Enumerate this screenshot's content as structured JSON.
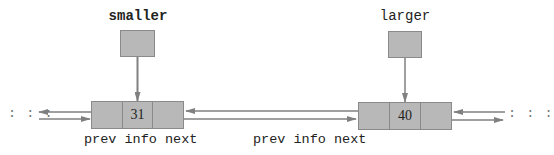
{
  "pointers": {
    "smaller": {
      "label": "smaller"
    },
    "larger": {
      "label": "larger"
    }
  },
  "nodes": [
    {
      "prev": "",
      "info": "31",
      "next": ""
    },
    {
      "prev": "",
      "info": "40",
      "next": ""
    }
  ],
  "field_labels": {
    "left": "prev info next",
    "middle": "prev info next"
  },
  "ellipsis": {
    "left": ": : :",
    "right": ": : :"
  },
  "colors": {
    "box_fill": "#b8b8b8",
    "box_border": "#8a8a8a",
    "arrow": "#808080"
  }
}
